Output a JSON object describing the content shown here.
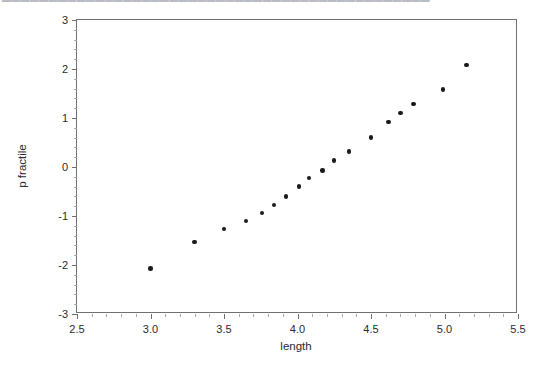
{
  "header": {
    "cut_off_text": "▬▬▬▬▬▬▬▬▬▬▬▬▬▬▬▬▬▬▬▬▬▬▬▬▬▬▬▬▬▬▬▬▬▬▬▬▬▬▬▬▬▬▬▬▬▬"
  },
  "chart_data": {
    "type": "scatter",
    "title": "",
    "xlabel": "length",
    "ylabel": "p fractile",
    "xlim": [
      2.5,
      5.5
    ],
    "ylim": [
      -3,
      3
    ],
    "xticks": [
      2.5,
      3.0,
      3.5,
      4.0,
      4.5,
      5.0,
      5.5
    ],
    "xticklabels": [
      "2.5",
      "3.0",
      "3.5",
      "4.0",
      "4.5",
      "5.0",
      "5.5"
    ],
    "yticks": [
      -3,
      -2,
      -1,
      0,
      1,
      2,
      3
    ],
    "yticklabels": [
      "-3",
      "-2",
      "-1",
      "0",
      "1",
      "2",
      "3"
    ],
    "grid": false,
    "legend": null,
    "marker": {
      "shape": "circle",
      "color": "#1a1a1a",
      "size_px": 4.4
    },
    "series": [
      {
        "name": "normal probability plot",
        "points": [
          {
            "x": 3.0,
            "y": -2.07
          },
          {
            "x": 3.3,
            "y": -1.53
          },
          {
            "x": 3.5,
            "y": -1.26
          },
          {
            "x": 3.65,
            "y": -1.1
          },
          {
            "x": 3.76,
            "y": -0.94
          },
          {
            "x": 3.84,
            "y": -0.78
          },
          {
            "x": 3.92,
            "y": -0.6
          },
          {
            "x": 4.01,
            "y": -0.4
          },
          {
            "x": 4.08,
            "y": -0.22
          },
          {
            "x": 4.17,
            "y": -0.07
          },
          {
            "x": 4.25,
            "y": 0.13
          },
          {
            "x": 4.35,
            "y": 0.32
          },
          {
            "x": 4.5,
            "y": 0.6
          },
          {
            "x": 4.62,
            "y": 0.92
          },
          {
            "x": 4.7,
            "y": 1.1
          },
          {
            "x": 4.79,
            "y": 1.29
          },
          {
            "x": 4.99,
            "y": 1.58
          },
          {
            "x": 5.15,
            "y": 2.08
          }
        ]
      }
    ]
  },
  "colors": {
    "axis": "#6f6f74",
    "minor_tick": "#a9a9ae",
    "marker": "#1a1a1a",
    "text": "#2b2b2b",
    "background": "#ffffff"
  }
}
